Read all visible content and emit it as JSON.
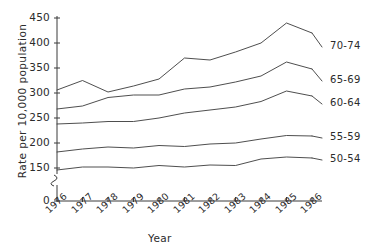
{
  "chart_data": {
    "type": "line",
    "title": "",
    "xlabel": "Year",
    "ylabel": "Rate per 10,000 population",
    "x": [
      1976,
      1977,
      1978,
      1979,
      1980,
      1981,
      1982,
      1983,
      1984,
      1985,
      1986
    ],
    "xtick_labels": [
      "1976",
      "1977",
      "1978",
      "1979",
      "1980",
      "1981",
      "1982",
      "1983",
      "1984",
      "1985",
      "1986"
    ],
    "ytick_labels": [
      "0",
      "150",
      "200",
      "250",
      "300",
      "350",
      "400",
      "450"
    ],
    "ylim": [
      150,
      450
    ],
    "ytick_values": [
      150,
      200,
      250,
      300,
      350,
      400,
      450
    ],
    "axis_break": true,
    "grid": false,
    "legend_position": "right",
    "series": [
      {
        "name": "70-74",
        "values": [
          306,
          325,
          302,
          314,
          328,
          370,
          366,
          382,
          400,
          440,
          420
        ]
      },
      {
        "name": "65-69",
        "values": [
          268,
          274,
          291,
          296,
          296,
          308,
          312,
          322,
          334,
          362,
          348
        ]
      },
      {
        "name": "60-64",
        "values": [
          238,
          240,
          243,
          243,
          250,
          260,
          266,
          272,
          283,
          304,
          294
        ]
      },
      {
        "name": "55-59",
        "values": [
          182,
          188,
          192,
          190,
          195,
          193,
          198,
          200,
          208,
          215,
          214
        ]
      },
      {
        "name": "50-54",
        "values": [
          146,
          152,
          152,
          150,
          155,
          152,
          156,
          155,
          168,
          172,
          170
        ]
      }
    ]
  },
  "legend": {
    "entries": [
      "70-74",
      "65-69",
      "60-64",
      "55-59",
      "50-54"
    ]
  }
}
